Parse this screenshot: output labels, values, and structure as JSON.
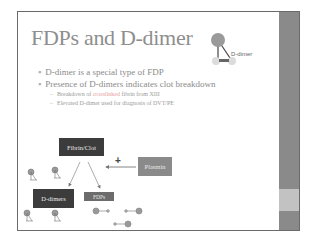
{
  "slide": {
    "title": "FDPs and D-dimer",
    "molecule_label": "D-dimer",
    "bullets": [
      {
        "text": "D-dimer is a special type of FDP",
        "level": 1
      },
      {
        "text": "Presence of D-dimers indicates clot breakdown",
        "level": 1
      },
      {
        "text_before": "Breakdown of ",
        "highlight": "crosslinked",
        "text_after": " fibrin from XIII",
        "level": 2
      },
      {
        "text": "Elevated D-dimer used for diagnosis of DVT/PE",
        "level": 2
      }
    ],
    "diagram": {
      "fibrin_clot": "Fibrin/Clot",
      "plasmin": "Plasmin",
      "plus": "+",
      "d_dimers": "D-dimers",
      "fdps": "FDPs",
      "fragment_label": "E"
    }
  },
  "colors": {
    "title": "#8e8e8e",
    "highlight": "#e6a0a0",
    "dark_box": "#3c3c3c",
    "plasmin_box": "#8a8a8a",
    "side_strip": "#8a8a8a",
    "side_band": "#c2c2c2"
  }
}
